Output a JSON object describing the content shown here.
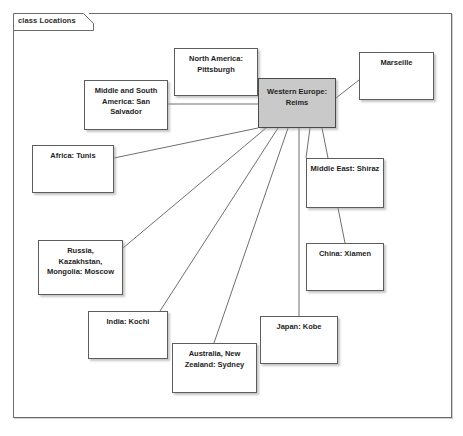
{
  "frame": {
    "tab_label": "class Locations",
    "border_color": "#6b6b6b"
  },
  "diagram": {
    "type": "uml-class-diagram",
    "hub_color": "#c9c9c9",
    "node_color": "#ffffff",
    "link_color": "#6f6f6f",
    "hub": {
      "name": "western-europe",
      "label": "Western Europe:\nReims",
      "x": 258,
      "y": 78,
      "w": 78,
      "h": 50
    },
    "nodes": [
      {
        "name": "north-america",
        "label": "North America:\nPittsburgh",
        "x": 174,
        "y": 48,
        "w": 84,
        "h": 48
      },
      {
        "name": "marseille",
        "label": "Marseille",
        "x": 359,
        "y": 52,
        "w": 75,
        "h": 48
      },
      {
        "name": "middle-south-america",
        "label": "Middle and South\nAmerica: San\nSalvador",
        "x": 84,
        "y": 80,
        "w": 84,
        "h": 50
      },
      {
        "name": "africa",
        "label": "Africa: Tunis",
        "x": 32,
        "y": 145,
        "w": 82,
        "h": 48
      },
      {
        "name": "middle-east",
        "label": "Middle East: Shiraz",
        "x": 306,
        "y": 158,
        "w": 78,
        "h": 50
      },
      {
        "name": "china",
        "label": "China: Xiamen",
        "x": 306,
        "y": 243,
        "w": 78,
        "h": 48
      },
      {
        "name": "russia-kazakhstan-mongolia",
        "label": "Russia,\nKazakhstan,\nMongolia: Moscow",
        "x": 38,
        "y": 240,
        "w": 85,
        "h": 55
      },
      {
        "name": "japan",
        "label": "Japan: Kobe",
        "x": 260,
        "y": 316,
        "w": 78,
        "h": 48
      },
      {
        "name": "india",
        "label": "India: Kochi",
        "x": 88,
        "y": 311,
        "w": 80,
        "h": 48
      },
      {
        "name": "australia-new-zealand",
        "label": "Australia, New\nZealand: Sydney",
        "x": 172,
        "y": 343,
        "w": 85,
        "h": 50
      }
    ],
    "links": [
      {
        "name": "link-north-america",
        "x1": 258,
        "y1": 95,
        "x2": 258,
        "y2": 95
      },
      {
        "name": "link-middle-south-america",
        "x1": 168,
        "y1": 104,
        "x2": 258,
        "y2": 104
      },
      {
        "name": "link-marseille",
        "x1": 336,
        "y1": 98,
        "x2": 359,
        "y2": 80
      },
      {
        "name": "link-africa",
        "x1": 114,
        "y1": 158,
        "x2": 258,
        "y2": 128
      },
      {
        "name": "link-middle-east",
        "x1": 310,
        "y1": 128,
        "x2": 306,
        "y2": 158
      },
      {
        "name": "link-china",
        "x1": 322,
        "y1": 128,
        "x2": 345,
        "y2": 243
      },
      {
        "name": "link-russia",
        "x1": 123,
        "y1": 248,
        "x2": 266,
        "y2": 128
      },
      {
        "name": "link-india",
        "x1": 160,
        "y1": 311,
        "x2": 278,
        "y2": 128
      },
      {
        "name": "link-australia",
        "x1": 214,
        "y1": 343,
        "x2": 288,
        "y2": 128
      },
      {
        "name": "link-japan",
        "x1": 299,
        "y1": 316,
        "x2": 299,
        "y2": 128
      }
    ]
  }
}
